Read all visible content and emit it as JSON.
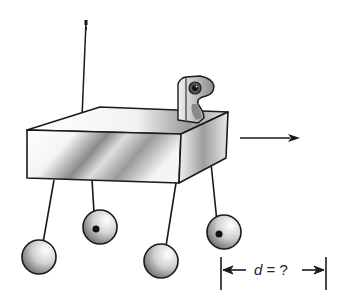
{
  "diagram": {
    "parts": [
      "antenna",
      "camera",
      "body",
      "legs",
      "wheels",
      "velocity-arrow",
      "distance-dimension"
    ],
    "dimension_label": {
      "variable": "d",
      "equals": "=",
      "value": "?"
    },
    "colors": {
      "stroke": "#1a1a1a",
      "shade_dark": "#6b6b6b",
      "shade_light": "#f2f2f2",
      "background": "#ffffff"
    }
  }
}
